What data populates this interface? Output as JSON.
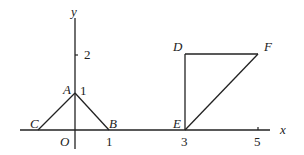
{
  "diagram": {
    "type": "coordinate-geometry-figure",
    "axes": {
      "x_label": "x",
      "y_label": "y",
      "origin_label": "O",
      "x_ticks": [
        "1",
        "3",
        "5"
      ],
      "y_ticks": [
        "1",
        "2"
      ]
    },
    "points": {
      "A": {
        "label": "A",
        "coords": [
          0,
          1
        ]
      },
      "B": {
        "label": "B",
        "coords": [
          1,
          0
        ]
      },
      "C": {
        "label": "C",
        "coords": [
          -1,
          0
        ]
      },
      "D": {
        "label": "D",
        "coords": [
          3,
          2
        ]
      },
      "E": {
        "label": "E",
        "coords": [
          3,
          0
        ]
      },
      "F": {
        "label": "F",
        "coords": [
          5,
          2
        ]
      }
    },
    "shapes": [
      {
        "name": "triangle-ABC",
        "vertices": [
          "A",
          "B",
          "C"
        ],
        "drawn_segments": [
          "CA",
          "AB"
        ]
      },
      {
        "name": "triangle-DEF",
        "vertices": [
          "D",
          "E",
          "F"
        ],
        "drawn_segments": [
          "DE",
          "DF",
          "EF"
        ]
      }
    ],
    "colors": {
      "stroke": "#222222",
      "background": "#ffffff"
    }
  }
}
